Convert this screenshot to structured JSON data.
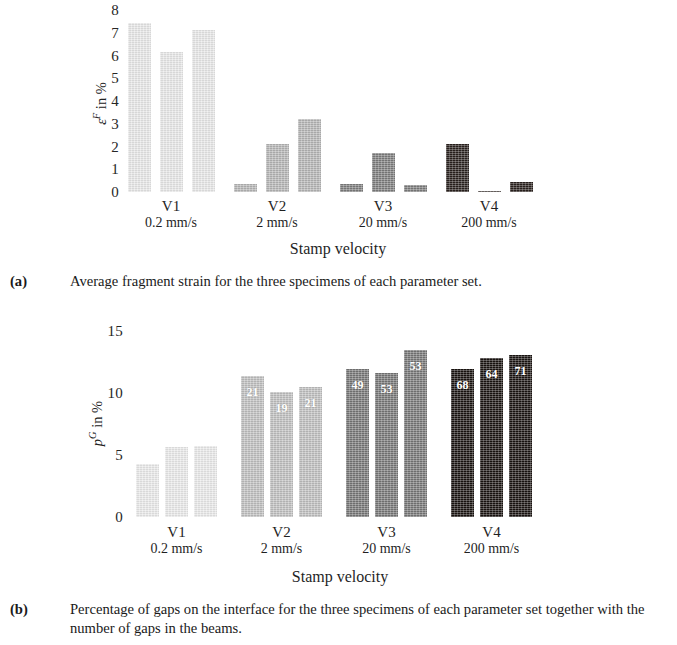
{
  "chart_data": [
    {
      "type": "bar",
      "panel": "a",
      "title": "",
      "xlabel": "Stamp velocity",
      "ylabel": "εF in %",
      "ylabel_parts": {
        "symbol": "ε",
        "sup": "F",
        "rest": " in %"
      },
      "ylim": [
        0,
        8
      ],
      "yticks": [
        0,
        1,
        2,
        3,
        4,
        5,
        6,
        7,
        8
      ],
      "ytick_labels": [
        "0",
        "1",
        "2",
        "3",
        "4",
        "5",
        "6",
        "7",
        "8"
      ],
      "grid": false,
      "legend": "none",
      "categories": [
        "V1",
        "V2",
        "V3",
        "V4"
      ],
      "category_sublabels": [
        "0.2 mm/s",
        "2 mm/s",
        "20 mm/s",
        "200 mm/s"
      ],
      "group_colors": [
        "#e9e9e9",
        "#b6b6b6",
        "#7d7d7d",
        "#2a211e"
      ],
      "groups": [
        {
          "category": "V1",
          "sublabel": "0.2 mm/s",
          "color": "#e9e9e9",
          "values": [
            7.45,
            6.15,
            7.1
          ],
          "labels": [
            "",
            "",
            ""
          ]
        },
        {
          "category": "V2",
          "sublabel": "2 mm/s",
          "color": "#b6b6b6",
          "values": [
            0.35,
            2.1,
            3.2
          ],
          "labels": [
            "",
            "",
            ""
          ]
        },
        {
          "category": "V3",
          "sublabel": "20 mm/s",
          "color": "#7d7d7d",
          "values": [
            0.35,
            1.7,
            0.3
          ],
          "labels": [
            "",
            "",
            ""
          ]
        },
        {
          "category": "V4",
          "sublabel": "200 mm/s",
          "color": "#2a211e",
          "values": [
            2.1,
            0.06,
            0.42
          ],
          "labels": [
            "",
            "",
            ""
          ]
        }
      ]
    },
    {
      "type": "bar",
      "panel": "b",
      "title": "",
      "xlabel": "Stamp velocity",
      "ylabel": "pG in %",
      "ylabel_parts": {
        "symbol": "p",
        "sup": "G",
        "rest": " in %"
      },
      "ylim": [
        0,
        15
      ],
      "yticks": [
        0,
        5,
        10,
        15
      ],
      "ytick_labels": [
        "0",
        "5",
        "10",
        "15"
      ],
      "grid": false,
      "legend": "none",
      "categories": [
        "V1",
        "V2",
        "V3",
        "V4"
      ],
      "category_sublabels": [
        "0.2 mm/s",
        "2 mm/s",
        "20 mm/s",
        "200 mm/s"
      ],
      "group_colors": [
        "#ebebeb",
        "#c0c0c0",
        "#767676",
        "#191310"
      ],
      "groups": [
        {
          "category": "V1",
          "sublabel": "0.2 mm/s",
          "color": "#ebebeb",
          "values": [
            4.3,
            5.65,
            5.7
          ],
          "labels": [
            "",
            "",
            ""
          ]
        },
        {
          "category": "V2",
          "sublabel": "2 mm/s",
          "color": "#c0c0c0",
          "values": [
            11.4,
            10.1,
            10.5
          ],
          "labels": [
            "21",
            "19",
            "21"
          ]
        },
        {
          "category": "V3",
          "sublabel": "20 mm/s",
          "color": "#767676",
          "values": [
            11.9,
            11.6,
            13.5
          ],
          "labels": [
            "49",
            "53",
            "53"
          ]
        },
        {
          "category": "V4",
          "sublabel": "200 mm/s",
          "color": "#191310",
          "values": [
            11.95,
            12.8,
            13.05
          ],
          "labels": [
            "68",
            "64",
            "71"
          ]
        }
      ]
    }
  ],
  "panel_a": {
    "caption_tag": "(a)",
    "caption_text": "Average fragment strain for the three specimens of each parameter set."
  },
  "panel_b": {
    "caption_tag": "(b)",
    "caption_text": "Percentage of gaps on the interface for the three specimens of each parameter set together with the number of gaps in the beams."
  }
}
